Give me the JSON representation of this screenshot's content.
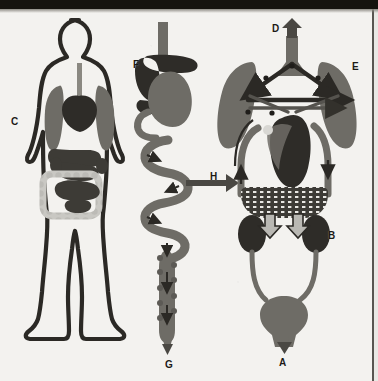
{
  "figure": {
    "panels": [
      {
        "id": "panel-body",
        "name": "human body silhouette with internal organs"
      },
      {
        "id": "panel-digestive",
        "name": "digestive tract from esophagus to rectum"
      },
      {
        "id": "panel-circulatory",
        "name": "circulatory system with lungs, heart, kidneys and bladder"
      }
    ]
  },
  "labels": [
    {
      "key": "A",
      "text": "A",
      "x": 279,
      "y": 358,
      "target": "urethra-outflow-arrow",
      "panel": "panel-circulatory"
    },
    {
      "key": "B",
      "text": "B",
      "x": 328,
      "y": 231,
      "target": "right-kidney",
      "panel": "panel-circulatory"
    },
    {
      "key": "C",
      "text": "C",
      "x": 11,
      "y": 117,
      "target": "body-silhouette",
      "panel": "panel-body"
    },
    {
      "key": "D",
      "text": "D",
      "x": 272,
      "y": 24,
      "target": "trachea-outflow-arrow",
      "panel": "panel-circulatory"
    },
    {
      "key": "E",
      "text": "E",
      "x": 352,
      "y": 62,
      "target": "right-lung",
      "panel": "panel-circulatory"
    },
    {
      "key": "F",
      "text": "F",
      "x": 133,
      "y": 60,
      "target": "liver",
      "panel": "panel-digestive"
    },
    {
      "key": "G",
      "text": "G",
      "x": 165,
      "y": 360,
      "target": "rectum-outflow-arrow",
      "panel": "panel-digestive"
    },
    {
      "key": "H",
      "text": "H",
      "x": 210,
      "y": 172,
      "target": "transfer-arrow",
      "panel": "panel-digestive"
    }
  ],
  "colors": {
    "background": "#f3f2ef",
    "ink_dark": "#3a3833",
    "organ_dark": "#3d3b36",
    "organ_mid": "#6e6c66",
    "organ_light": "#c9c8c3",
    "outline": "#2b2925",
    "label_text": "#1c1a16",
    "scan_band": "#16140f"
  },
  "structures": {
    "body_panel": [
      {
        "name": "body-outline",
        "shade": "outline"
      },
      {
        "name": "left-lung",
        "shade": "organ_mid"
      },
      {
        "name": "right-lung",
        "shade": "organ_mid"
      },
      {
        "name": "heart",
        "shade": "organ_dark"
      },
      {
        "name": "trachea",
        "shade": "organ_mid"
      },
      {
        "name": "stomach",
        "shade": "organ_dark"
      },
      {
        "name": "liver",
        "shade": "organ_dark"
      },
      {
        "name": "small-intestine",
        "shade": "organ_dark"
      },
      {
        "name": "large-intestine",
        "shade": "organ_light"
      },
      {
        "name": "kidneys",
        "shade": "organ_dark"
      }
    ],
    "digestive_panel": [
      {
        "name": "esophagus",
        "shade": "organ_mid"
      },
      {
        "name": "liver",
        "shade": "organ_dark"
      },
      {
        "name": "stomach",
        "shade": "organ_mid"
      },
      {
        "name": "small-intestine",
        "shade": "organ_mid"
      },
      {
        "name": "large-intestine",
        "shade": "organ_mid"
      },
      {
        "name": "rectum",
        "shade": "organ_mid"
      },
      {
        "name": "flow-arrows",
        "shade": "ink_dark"
      }
    ],
    "circulatory_panel": [
      {
        "name": "trachea",
        "shade": "organ_mid"
      },
      {
        "name": "left-lung",
        "shade": "organ_mid"
      },
      {
        "name": "right-lung",
        "shade": "organ_mid"
      },
      {
        "name": "heart",
        "shade": "organ_dark"
      },
      {
        "name": "pulmonary-vessels",
        "shade": "ink_dark"
      },
      {
        "name": "systemic-vessels",
        "shade": "organ_mid"
      },
      {
        "name": "capillary-bed",
        "shade": "organ_dark"
      },
      {
        "name": "left-kidney",
        "shade": "organ_dark"
      },
      {
        "name": "right-kidney",
        "shade": "organ_dark"
      },
      {
        "name": "ureters",
        "shade": "organ_mid"
      },
      {
        "name": "bladder",
        "shade": "organ_mid"
      }
    ]
  }
}
